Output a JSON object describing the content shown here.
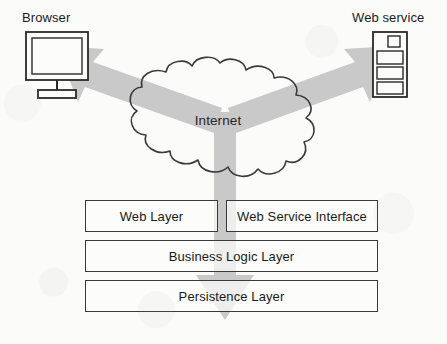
{
  "diagram": {
    "background_color": "#fbfbfa",
    "line_color": "#3a3a3a",
    "arrow_color": "#c9c9c9"
  },
  "nodes": {
    "browser": {
      "label": "Browser",
      "icon": "monitor-icon"
    },
    "web_service": {
      "label": "Web service",
      "icon": "server-rack-icon",
      "slots": 4
    },
    "internet": {
      "label": "Internet",
      "icon": "cloud-icon"
    }
  },
  "layers": {
    "row1": [
      {
        "label": "Web Layer"
      },
      {
        "label": "Web Service Interface"
      }
    ],
    "row2": [
      {
        "label": "Business Logic Layer"
      }
    ],
    "row3": [
      {
        "label": "Persistence Layer"
      }
    ]
  },
  "connectors": [
    {
      "name": "internet-to-browser",
      "direction": "up-left",
      "style": "block-arrow"
    },
    {
      "name": "internet-to-web-service",
      "direction": "up-right",
      "style": "block-arrow"
    },
    {
      "name": "internet-to-layers",
      "direction": "down",
      "style": "block-arrow"
    }
  ]
}
